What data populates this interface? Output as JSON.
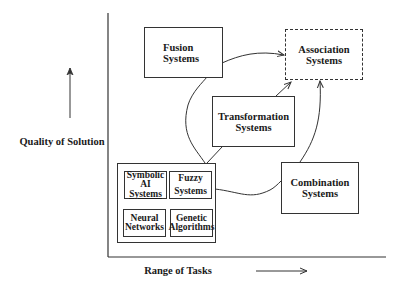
{
  "diagram": {
    "axes": {
      "y_label": "Quality of Solution",
      "x_label": "Range of Tasks"
    },
    "nodes": {
      "fusion": {
        "line1": "Fusion",
        "line2": "Systems"
      },
      "association": {
        "line1": "Association",
        "line2": "Systems",
        "style": "dashed"
      },
      "transformation": {
        "line1": "Transformation",
        "line2": "Systems"
      },
      "combination": {
        "line1": "Combination",
        "line2": "Systems"
      },
      "base_group": {
        "symbolic_ai": {
          "line1": "Symbolic",
          "line2": "AI",
          "line3": "Systems"
        },
        "fuzzy": {
          "line1": "Fuzzy",
          "line2": "Systems"
        },
        "neural": {
          "line1": "Neural",
          "line2": "Networks"
        },
        "genetic": {
          "line1": "Genetic",
          "line2": "Algorithms"
        }
      }
    },
    "edges": [
      {
        "from": "base_group",
        "to": "fusion"
      },
      {
        "from": "base_group",
        "to": "transformation"
      },
      {
        "from": "base_group",
        "to": "combination"
      },
      {
        "from": "fusion",
        "to": "association",
        "arrow": true
      },
      {
        "from": "transformation",
        "to": "association",
        "arrow": true
      },
      {
        "from": "combination",
        "to": "association",
        "arrow": true
      }
    ],
    "colors": {
      "line": "#333333",
      "background": "#ffffff"
    }
  }
}
